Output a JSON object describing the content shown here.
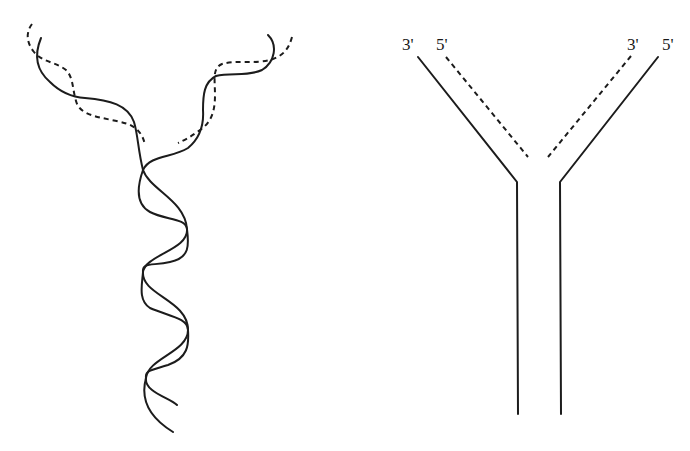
{
  "figure": {
    "left_panel": {
      "description": "DNA double helix unwinding at replication fork (wavy strands)",
      "strands": [
        "parental-strand-solid",
        "new-strand-dashed"
      ]
    },
    "right_panel": {
      "description": "Schematic replication fork (Y shape)",
      "labels": {
        "left_outer": "3'",
        "left_inner": "5'",
        "right_inner": "3'",
        "right_outer": "5'"
      }
    },
    "colors": {
      "stroke": "#1c1c1c",
      "background": "#ffffff"
    }
  }
}
